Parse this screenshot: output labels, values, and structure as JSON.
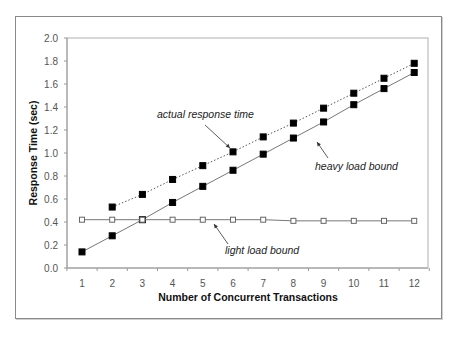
{
  "chart_data": {
    "type": "line",
    "title": "",
    "xlabel": "Number of Concurrent Transactions",
    "ylabel": "Response Time (sec)",
    "x": [
      1,
      2,
      3,
      4,
      5,
      6,
      7,
      8,
      9,
      10,
      11,
      12
    ],
    "xlim": [
      0.5,
      12.5
    ],
    "ylim": [
      0.0,
      2.0
    ],
    "yticks": [
      "0.0",
      "0.2",
      "0.4",
      "0.6",
      "0.8",
      "1.0",
      "1.2",
      "1.4",
      "1.6",
      "1.8",
      "2.0"
    ],
    "xticks": [
      "1",
      "2",
      "3",
      "4",
      "5",
      "6",
      "7",
      "8",
      "9",
      "10",
      "11",
      "12"
    ],
    "grid": false,
    "legend": "none (inline annotations)",
    "series": [
      {
        "name": "actual response time",
        "style": "dotted line, filled square markers",
        "x": [
          2,
          3,
          4,
          5,
          6,
          7,
          8,
          9,
          10,
          11,
          12
        ],
        "values": [
          0.53,
          0.64,
          0.77,
          0.89,
          1.01,
          1.14,
          1.26,
          1.39,
          1.52,
          1.65,
          1.78
        ]
      },
      {
        "name": "heavy load bound",
        "style": "solid line, filled square markers",
        "x": [
          1,
          2,
          3,
          4,
          5,
          6,
          7,
          8,
          9,
          10,
          11,
          12
        ],
        "values": [
          0.14,
          0.28,
          0.42,
          0.57,
          0.71,
          0.85,
          0.99,
          1.13,
          1.27,
          1.42,
          1.56,
          1.7
        ]
      },
      {
        "name": "light load bound",
        "style": "solid line, open square markers",
        "x": [
          1,
          2,
          3,
          4,
          5,
          6,
          7,
          8,
          9,
          10,
          11,
          12
        ],
        "values": [
          0.42,
          0.42,
          0.42,
          0.42,
          0.42,
          0.42,
          0.42,
          0.41,
          0.41,
          0.41,
          0.41,
          0.41
        ]
      }
    ],
    "annotations": [
      {
        "text": "actual response time",
        "points_to_x": 6
      },
      {
        "text": "heavy load bound",
        "points_to_x": 8.5
      },
      {
        "text": "light load bound",
        "points_to_x": 5.5
      }
    ]
  },
  "colors": {
    "frame": "#8a8a8a",
    "axis": "#9a9a9a",
    "line": "#777777",
    "marker_fill": "#000000",
    "open_marker_fill": "#ffffff"
  }
}
